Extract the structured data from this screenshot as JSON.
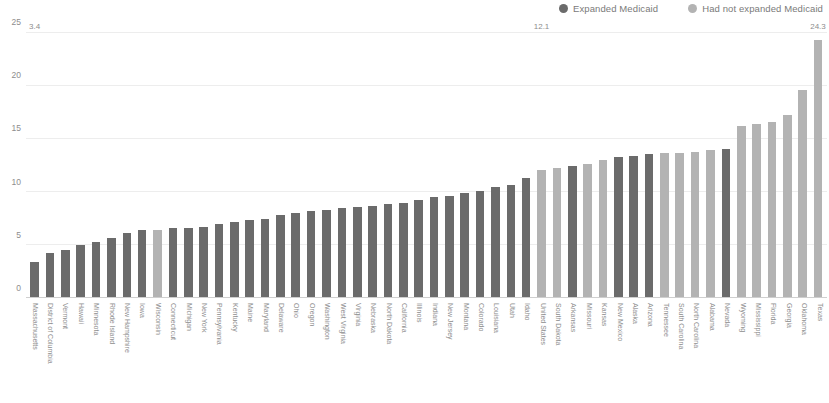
{
  "legend": {
    "position": "top-right",
    "items": [
      {
        "label": "Expanded Medicaid",
        "color": "#6b6b6b"
      },
      {
        "label": "Had not expanded Medicaid",
        "color": "#b3b3b3"
      }
    ]
  },
  "axis": {
    "y_ticks": [
      "0",
      "5",
      "10",
      "15",
      "20",
      "25"
    ]
  },
  "chart_data": {
    "type": "bar",
    "title": "",
    "subtitle": "",
    "xlabel": "",
    "ylabel": "",
    "ylim": [
      0,
      25
    ],
    "yticks": [
      0,
      5,
      10,
      15,
      20,
      25
    ],
    "grid": true,
    "legend_position": "top-right",
    "series": [
      {
        "name": "Expanded Medicaid",
        "color": "#6b6b6b"
      },
      {
        "name": "Had not expanded Medicaid",
        "color": "#b3b3b3"
      }
    ],
    "categories": [
      "Massachusetts",
      "District of Columbia",
      "Vermont",
      "Hawaii",
      "Minnesota",
      "Rhode Island",
      "New Hampshire",
      "Iowa",
      "Wisconsin",
      "Connecticut",
      "Michigan",
      "New York",
      "Pennsylvania",
      "Kentucky",
      "Maine",
      "Maryland",
      "Delaware",
      "Ohio",
      "Oregon",
      "Washington",
      "West Virginia",
      "Virginia",
      "Nebraska",
      "North Dakota",
      "California",
      "Illinois",
      "Indiana",
      "New Jersey",
      "Montana",
      "Colorado",
      "Louisiana",
      "Utah",
      "Idaho",
      "United States",
      "South Dakota",
      "Arkansas",
      "Missouri",
      "Kansas",
      "New Mexico",
      "Alaska",
      "Arizona",
      "Tennessee",
      "South Carolina",
      "North Carolina",
      "Alabama",
      "Nevada",
      "Wyoming",
      "Mississippi",
      "Florida",
      "Georgia",
      "Oklahoma",
      "Texas"
    ],
    "values": [
      3.4,
      4.2,
      4.5,
      5.0,
      5.3,
      5.7,
      6.1,
      6.4,
      6.4,
      6.6,
      6.6,
      6.7,
      7.0,
      7.2,
      7.4,
      7.5,
      7.8,
      8.0,
      8.2,
      8.3,
      8.5,
      8.6,
      8.7,
      8.9,
      9.0,
      9.2,
      9.5,
      9.6,
      9.9,
      10.1,
      10.5,
      10.7,
      11.3,
      12.1,
      12.3,
      12.5,
      12.6,
      13.0,
      13.3,
      13.4,
      13.6,
      13.7,
      13.7,
      13.8,
      14.0,
      14.1,
      16.2,
      16.4,
      16.6,
      17.3,
      19.6,
      24.3
    ],
    "group_of": [
      "Expanded Medicaid",
      "Expanded Medicaid",
      "Expanded Medicaid",
      "Expanded Medicaid",
      "Expanded Medicaid",
      "Expanded Medicaid",
      "Expanded Medicaid",
      "Expanded Medicaid",
      "Had not expanded Medicaid",
      "Expanded Medicaid",
      "Expanded Medicaid",
      "Expanded Medicaid",
      "Expanded Medicaid",
      "Expanded Medicaid",
      "Expanded Medicaid",
      "Expanded Medicaid",
      "Expanded Medicaid",
      "Expanded Medicaid",
      "Expanded Medicaid",
      "Expanded Medicaid",
      "Expanded Medicaid",
      "Expanded Medicaid",
      "Expanded Medicaid",
      "Expanded Medicaid",
      "Expanded Medicaid",
      "Expanded Medicaid",
      "Expanded Medicaid",
      "Expanded Medicaid",
      "Expanded Medicaid",
      "Expanded Medicaid",
      "Expanded Medicaid",
      "Expanded Medicaid",
      "Expanded Medicaid",
      "Had not expanded Medicaid",
      "Had not expanded Medicaid",
      "Expanded Medicaid",
      "Had not expanded Medicaid",
      "Had not expanded Medicaid",
      "Expanded Medicaid",
      "Expanded Medicaid",
      "Expanded Medicaid",
      "Had not expanded Medicaid",
      "Had not expanded Medicaid",
      "Had not expanded Medicaid",
      "Had not expanded Medicaid",
      "Expanded Medicaid",
      "Had not expanded Medicaid",
      "Had not expanded Medicaid",
      "Had not expanded Medicaid",
      "Had not expanded Medicaid",
      "Had not expanded Medicaid",
      "Had not expanded Medicaid"
    ],
    "data_labels": {
      "Massachusetts": "3.4",
      "United States": "12.1",
      "Texas": "24.3"
    }
  }
}
